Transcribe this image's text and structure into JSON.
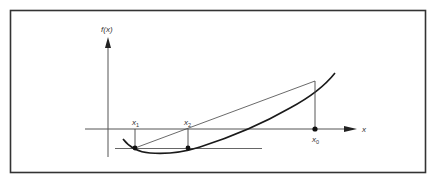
{
  "diagram": {
    "y_axis_label": "f(x)",
    "x_axis_label": "x",
    "points": [
      {
        "id": "x1",
        "label": "x",
        "subscript": "1"
      },
      {
        "id": "x2",
        "label": "x",
        "subscript": "2"
      },
      {
        "id": "x0",
        "label": "x",
        "subscript": "0"
      }
    ],
    "colors": {
      "frame": "#333333",
      "axes": "#555555",
      "curve": "#1a1a1a",
      "background": "#ffffff"
    }
  }
}
